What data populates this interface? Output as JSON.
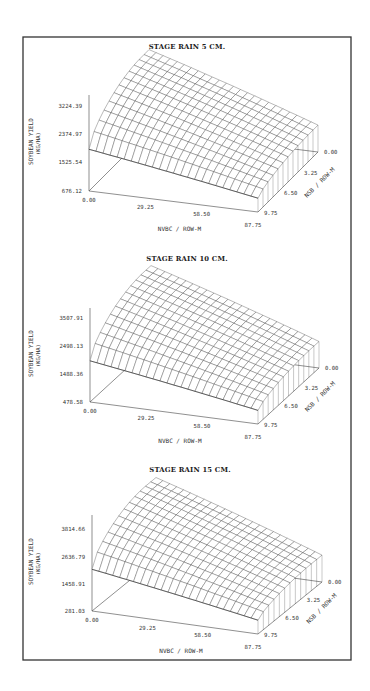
{
  "figure": {
    "frame": {
      "x": 23,
      "y": 37,
      "w": 328,
      "h": 623
    }
  },
  "chart_data": [
    {
      "type": "surface",
      "title": "STAGE RAIN 5 CM.",
      "xlabel": "NVBC / ROW-M",
      "ylabel": "NSB / ROW-M",
      "zlabel": "SOYBEAN YIELD (KG/HA)",
      "zlabel_line1": "SOYBEAN YIELD",
      "zlabel_line2": "(KG/HA)",
      "x_ticks": [
        "0.00",
        "29.25",
        "58.50",
        "87.75"
      ],
      "y_ticks": [
        "0.00",
        "3.25",
        "6.50",
        "9.75"
      ],
      "z_ticks": [
        "676.12",
        "1525.54",
        "2374.97",
        "3224.39"
      ],
      "xlim": [
        0,
        87.75
      ],
      "ylim": [
        0,
        9.75
      ],
      "zlim": [
        676.12,
        3224.39
      ],
      "grid": false,
      "description": "Yield surface peaks at low NVBC and NSB near 0, declining with increasing NVBC and NSB"
    },
    {
      "type": "surface",
      "title": "STAGE RAIN 10 CM.",
      "xlabel": "NVBC / ROW-M",
      "ylabel": "NSB / ROW-M",
      "zlabel": "SOYBEAN YIELD (KG/HA)",
      "zlabel_line1": "SOYBEAN YIELD",
      "zlabel_line2": "(KG/HA)",
      "x_ticks": [
        "0.00",
        "29.25",
        "58.50",
        "87.75"
      ],
      "y_ticks": [
        "0.00",
        "3.25",
        "6.50",
        "9.75"
      ],
      "z_ticks": [
        "478.58",
        "1488.36",
        "2498.13",
        "3507.91"
      ],
      "xlim": [
        0,
        87.75
      ],
      "ylim": [
        0,
        9.75
      ],
      "zlim": [
        478.58,
        3507.91
      ],
      "grid": false
    },
    {
      "type": "surface",
      "title": "STAGE RAIN 15 CM.",
      "xlabel": "NVBC / ROW-M",
      "ylabel": "NSB / ROW-M",
      "zlabel": "SOYBEAN YIELD (KG/HA)",
      "zlabel_line1": "SOYBEAN YIELD",
      "zlabel_line2": "(KG/HA)",
      "x_ticks": [
        "0.00",
        "29.25",
        "58.50",
        "87.75"
      ],
      "y_ticks": [
        "0.00",
        "3.25",
        "6.50",
        "9.75"
      ],
      "z_ticks": [
        "281.03",
        "1458.91",
        "2636.79",
        "3814.66"
      ],
      "xlim": [
        0,
        87.75
      ],
      "ylim": [
        0,
        9.75
      ],
      "zlim": [
        281.03,
        3814.66
      ],
      "grid": false
    }
  ],
  "layout": {
    "panels": [
      {
        "title_x": 187,
        "title_y": 49,
        "ox": 89,
        "oy": 191,
        "ztop": 95,
        "xe": [
          258,
          212
        ],
        "de": [
          318,
          152
        ],
        "peak": [
          152,
          50
        ],
        "corner_far_hi": 0.55,
        "ztick_y": [
          191,
          162,
          134,
          106
        ]
      },
      {
        "title_x": 187,
        "title_y": 261,
        "ox": 90,
        "oy": 402,
        "ztop": 308,
        "xe": [
          258,
          424
        ],
        "de": [
          319,
          368
        ],
        "peak": [
          154,
          266
        ],
        "corner_far_hi": 0.45,
        "ztick_y": [
          402,
          374,
          346,
          318
        ]
      },
      {
        "title_x": 190,
        "title_y": 472,
        "ox": 92,
        "oy": 611,
        "ztop": 515,
        "xe": [
          258,
          634
        ],
        "de": [
          322,
          582
        ],
        "peak": [
          158,
          478
        ],
        "corner_far_hi": 0.45,
        "ztick_y": [
          611,
          584,
          557,
          529
        ]
      }
    ]
  }
}
